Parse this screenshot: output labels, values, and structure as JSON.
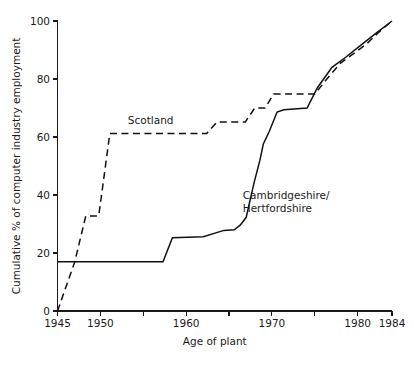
{
  "chart_data": {
    "type": "line",
    "title": "",
    "subtitle": "",
    "xlabel": "Age of plant",
    "ylabel": "Cumulative % of computer industry employment",
    "xlim": [
      1945,
      1984
    ],
    "ylim": [
      0,
      100
    ],
    "grid": false,
    "legend_position": "inline-annotation",
    "x_tick_labels": [
      "1945",
      "1950",
      "1960",
      "1970",
      "1980",
      "1984"
    ],
    "x_tick_label_values": [
      1945,
      1950,
      1960,
      1970,
      1980,
      1984
    ],
    "x_tick_values": [
      1945,
      1950,
      1955,
      1960,
      1965,
      1970,
      1975,
      1980,
      1984
    ],
    "y_tick_labels": [
      "0",
      "20",
      "40",
      "60",
      "80",
      "100"
    ],
    "y_tick_values": [
      0,
      20,
      40,
      60,
      80,
      100
    ],
    "series": [
      {
        "name": "Scotland",
        "style": "dashed",
        "color": "#111111",
        "label_position": {
          "x": 1953.2,
          "y": 64.5
        },
        "points": [
          [
            1945.0,
            0.0
          ],
          [
            1947.0,
            16.8
          ],
          [
            1948.3,
            32.8
          ],
          [
            1949.8,
            32.8
          ],
          [
            1950.0,
            37.0
          ],
          [
            1951.1,
            61.2
          ],
          [
            1962.4,
            61.2
          ],
          [
            1963.6,
            65.2
          ],
          [
            1966.9,
            65.2
          ],
          [
            1968.0,
            70.0
          ],
          [
            1969.2,
            70.0
          ],
          [
            1970.2,
            74.8
          ],
          [
            1975.0,
            74.8
          ],
          [
            1976.4,
            80.0
          ],
          [
            1978.0,
            85.5
          ],
          [
            1979.4,
            88.5
          ],
          [
            1981.0,
            92.0
          ],
          [
            1982.4,
            96.0
          ],
          [
            1984.0,
            100.0
          ]
        ]
      },
      {
        "name": "Cambridgeshire/\nHertfordshire",
        "name_line1": "Cambridgeshire/",
        "name_line2": "Hertfordshire",
        "style": "solid",
        "color": "#111111",
        "label_position": {
          "x": 1966.6,
          "y": 38.5
        },
        "points": [
          [
            1945.0,
            17.0
          ],
          [
            1957.3,
            17.0
          ],
          [
            1958.4,
            25.3
          ],
          [
            1962.0,
            25.6
          ],
          [
            1964.4,
            27.8
          ],
          [
            1965.6,
            28.0
          ],
          [
            1966.3,
            29.6
          ],
          [
            1967.0,
            32.3
          ],
          [
            1967.9,
            44.0
          ],
          [
            1968.6,
            52.0
          ],
          [
            1969.0,
            57.6
          ],
          [
            1969.7,
            62.0
          ],
          [
            1970.6,
            68.6
          ],
          [
            1971.4,
            69.4
          ],
          [
            1974.1,
            70.0
          ],
          [
            1975.3,
            77.0
          ],
          [
            1977.0,
            84.0
          ],
          [
            1978.6,
            87.5
          ],
          [
            1980.3,
            91.5
          ],
          [
            1982.0,
            95.5
          ],
          [
            1984.0,
            100.0
          ]
        ]
      }
    ]
  }
}
